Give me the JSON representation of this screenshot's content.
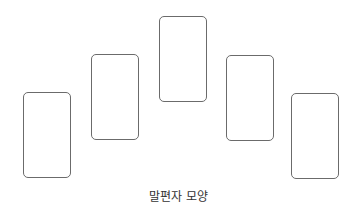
{
  "diagram": {
    "caption": "말편자 모양",
    "cards": [
      {
        "id": "card-1"
      },
      {
        "id": "card-2"
      },
      {
        "id": "card-3"
      },
      {
        "id": "card-4"
      },
      {
        "id": "card-5"
      }
    ],
    "colors": {
      "outline": "#6b6b6b",
      "background": "#ffffff",
      "text": "#333333"
    }
  }
}
